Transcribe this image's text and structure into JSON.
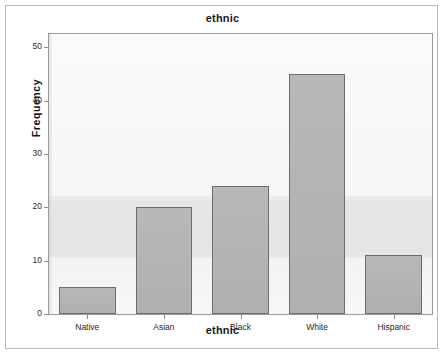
{
  "window": {
    "title": "ethnic"
  },
  "chart_data": {
    "type": "bar",
    "title": "ethnic",
    "xlabel": "ethnic",
    "ylabel": "Frequency",
    "categories": [
      "Native",
      "Asian",
      "Black",
      "White",
      "Hispanic"
    ],
    "values": [
      5,
      20,
      24,
      45,
      11
    ],
    "ylim": [
      0,
      52.5
    ],
    "yticks": [
      0,
      10,
      20,
      30,
      40,
      50
    ],
    "ytick_labels": [
      "0",
      "10",
      "20",
      "30",
      "40",
      "50"
    ],
    "grid": false,
    "legend": false,
    "bar_fill": "#b3b3b3",
    "bar_border": "#6d6d6d",
    "plot_background": "#f4f4f4",
    "frame_color": "#b9b9b9"
  }
}
